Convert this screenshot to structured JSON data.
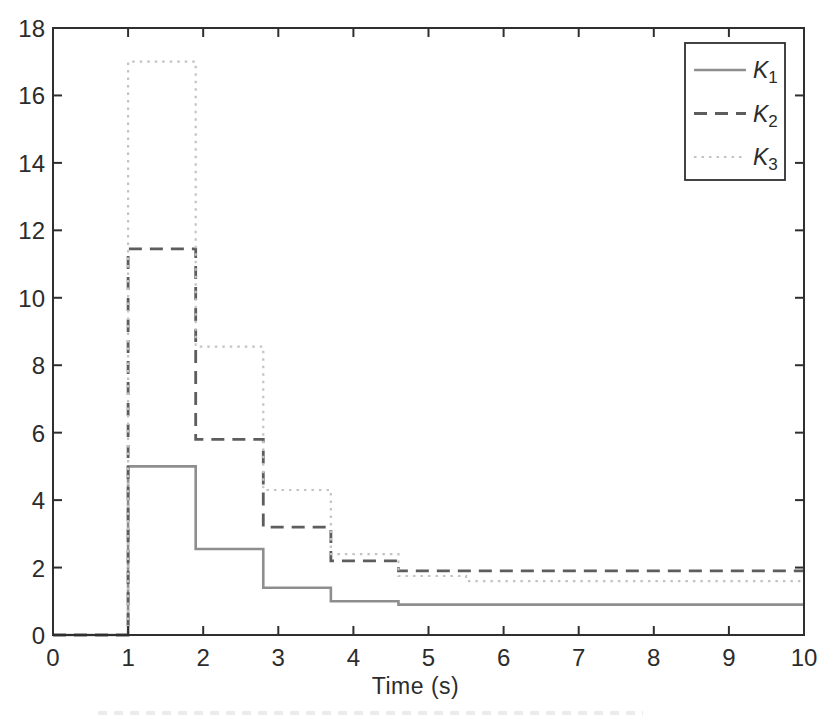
{
  "chart_data": {
    "type": "line",
    "subtype": "step-post",
    "title": "",
    "xlabel": "Time (s)",
    "ylabel": "",
    "xlim": [
      0,
      10
    ],
    "ylim": [
      0,
      18
    ],
    "xticks": [
      0,
      1,
      2,
      3,
      4,
      5,
      6,
      7,
      8,
      9,
      10
    ],
    "yticks": [
      0,
      2,
      4,
      6,
      8,
      10,
      12,
      14,
      16,
      18
    ],
    "grid": false,
    "box": true,
    "tick_direction": "in",
    "frame_color": "#2f2f2f",
    "text_color": "#2c2c2c",
    "background": "#ffffff",
    "legend": {
      "position": "top-right",
      "border": true,
      "entries": [
        {
          "base": "K",
          "sub": "1"
        },
        {
          "base": "K",
          "sub": "2"
        },
        {
          "base": "K",
          "sub": "3"
        }
      ]
    },
    "series": [
      {
        "name": "K1",
        "label_base": "K",
        "label_sub": "1",
        "line_style": "solid",
        "color": "#8e8e8e",
        "width": 2.6,
        "x": [
          0,
          1,
          1.9,
          2.8,
          3.7,
          4.6,
          10
        ],
        "y": [
          0,
          5.0,
          2.55,
          1.4,
          1.0,
          0.9,
          0.9
        ]
      },
      {
        "name": "K2",
        "label_base": "K",
        "label_sub": "2",
        "line_style": "dashed",
        "color": "#5d5d5d",
        "width": 2.8,
        "x": [
          0,
          1,
          1.9,
          2.8,
          3.7,
          4.6,
          10
        ],
        "y": [
          0,
          11.45,
          5.8,
          3.2,
          2.2,
          1.9,
          1.9
        ]
      },
      {
        "name": "K3",
        "label_base": "K",
        "label_sub": "3",
        "line_style": "dotted",
        "color": "#c3c3c3",
        "width": 2.2,
        "x": [
          0,
          1,
          1.9,
          2.8,
          3.7,
          4.6,
          5.5,
          10
        ],
        "y": [
          0,
          17.0,
          8.55,
          4.3,
          2.4,
          1.75,
          1.6,
          1.6
        ]
      }
    ]
  }
}
